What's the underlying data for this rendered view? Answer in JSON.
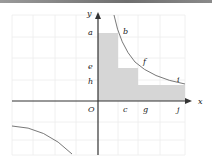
{
  "figure": {
    "axes": {
      "x_label": "x",
      "y_label": "y",
      "origin_label": "O"
    },
    "y_labels": [
      "a",
      "e",
      "h"
    ],
    "x_labels": [
      "c",
      "g",
      "j"
    ],
    "curve_labels": [
      "b",
      "f",
      "i"
    ],
    "colors": {
      "shade": "#d6d6d6",
      "axis": "#333333",
      "grid": "#ececec",
      "curve": "#555555"
    }
  }
}
